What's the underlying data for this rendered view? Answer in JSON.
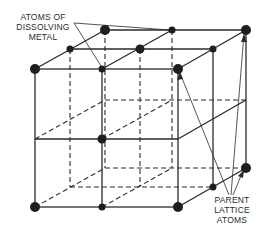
{
  "diagram": {
    "type": "crystal-lattice",
    "colors": {
      "line": "#2a2a2a",
      "atom": "#1e1e1e",
      "background": "#ffffff"
    }
  },
  "labels": {
    "dissolving_metal": [
      "ATOMS OF",
      "DISSOLVING",
      "METAL"
    ],
    "parent_lattice": [
      "PARENT",
      "LATTICE",
      "ATOMS"
    ]
  },
  "atoms": {
    "dissolving_metal": [
      {
        "x": 102,
        "y": 69,
        "r": 3.5
      },
      {
        "x": 172,
        "y": 30,
        "r": 3.5
      }
    ],
    "parent_lattice": [
      {
        "x": 35,
        "y": 69,
        "r": 5
      },
      {
        "x": 178,
        "y": 69,
        "r": 5
      },
      {
        "x": 105,
        "y": 30,
        "r": 5
      },
      {
        "x": 246,
        "y": 30,
        "r": 5
      },
      {
        "x": 35,
        "y": 207,
        "r": 5
      },
      {
        "x": 178,
        "y": 207,
        "r": 5
      },
      {
        "x": 246,
        "y": 168,
        "r": 5
      },
      {
        "x": 70,
        "y": 49,
        "r": 3.5
      },
      {
        "x": 213,
        "y": 49,
        "r": 3.5
      },
      {
        "x": 140,
        "y": 49,
        "r": 4.5
      },
      {
        "x": 102,
        "y": 139,
        "r": 4.5
      },
      {
        "x": 102,
        "y": 207,
        "r": 3.5
      },
      {
        "x": 213,
        "y": 187,
        "r": 3.5
      }
    ]
  }
}
